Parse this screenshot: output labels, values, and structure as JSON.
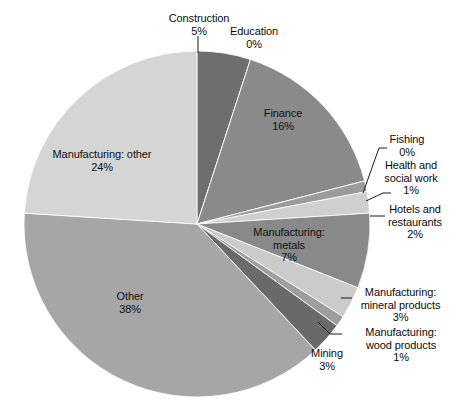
{
  "chart_data": {
    "type": "pie",
    "title": "",
    "legend_position": "none",
    "labels_show_percent": true,
    "start_angle_deg": 0,
    "direction": "clockwise",
    "categories": [
      "Construction",
      "Education",
      "Finance",
      "Fishing",
      "Health and social work",
      "Hotels and restaurants",
      "Manufacturing: metals",
      "Manufacturing: mineral products",
      "Manufacturing: wood products",
      "Mining",
      "Other",
      "Manufacturing: other"
    ],
    "values": [
      5,
      0,
      16,
      0,
      1,
      2,
      7,
      3,
      1,
      3,
      38,
      24
    ],
    "value_labels": [
      "5%",
      "0%",
      "16%",
      "0%",
      "1%",
      "2%",
      "7%",
      "3%",
      "1%",
      "3%",
      "38%",
      "24%"
    ],
    "colors": [
      "#6e6e6e",
      "#8f8f8f",
      "#8a8a8a",
      "#5d5d5d",
      "#9b9b9b",
      "#cfcfcf",
      "#898989",
      "#cbcbcb",
      "#9e9e9e",
      "#6a6a6a",
      "#a6a6a6",
      "#d5d5d5"
    ]
  },
  "labels": {
    "construction": {
      "name": "Construction",
      "pct": "5%"
    },
    "education": {
      "name": "Education",
      "pct": "0%"
    },
    "finance": {
      "name": "Finance",
      "pct": "16%"
    },
    "fishing": {
      "name": "Fishing",
      "pct": "0%"
    },
    "health": {
      "name_line1": "Health and",
      "name_line2": "social work",
      "pct": "1%"
    },
    "hotels": {
      "name_line1": "Hotels and",
      "name_line2": "restaurants",
      "pct": "2%"
    },
    "mfg_metals": {
      "name_line1": "Manufacturing:",
      "name_line2": "metals",
      "pct": "7%"
    },
    "mfg_mineral": {
      "name_line1": "Manufacturing:",
      "name_line2": "mineral products",
      "pct": "3%"
    },
    "mfg_wood": {
      "name_line1": "Manufacturing:",
      "name_line2": "wood products",
      "pct": "1%"
    },
    "mining": {
      "name": "Mining",
      "pct": "3%"
    },
    "other": {
      "name": "Other",
      "pct": "38%"
    },
    "mfg_other": {
      "name": "Manufacturing: other",
      "pct": "24%"
    }
  }
}
